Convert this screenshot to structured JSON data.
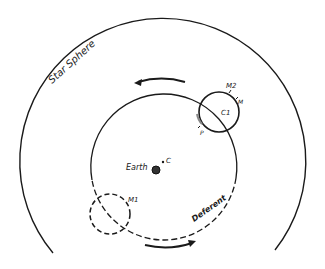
{
  "diagram": {
    "type": "ptolemaic-epicycle-model",
    "labels": {
      "star_sphere": "Star Sphere",
      "earth": "Earth",
      "center": "C",
      "deferent": "Deferent",
      "epicycle_center": "C1",
      "point_m": "M",
      "point_m2": "M2",
      "point_p": "P",
      "point_m1": "M1"
    },
    "colors": {
      "ink": "#1a1a1a",
      "background": "#ffffff"
    }
  }
}
